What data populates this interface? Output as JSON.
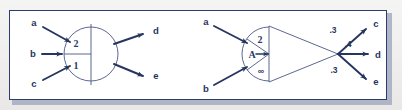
{
  "figure": {
    "background_color": "#f1f0ee",
    "panel_color": "#ffffff",
    "border_color": "#2d3d6b",
    "ink_color": "#27355f",
    "diagrams": [
      {
        "id": "left-diagram",
        "shape": "circle-split-quadrants",
        "inputs": [
          {
            "label": "a"
          },
          {
            "label": "b"
          },
          {
            "label": "c"
          }
        ],
        "node_cells": [
          {
            "label": "2"
          },
          {
            "label": "1"
          }
        ],
        "outputs": [
          {
            "label": "d"
          },
          {
            "label": "e"
          }
        ]
      },
      {
        "id": "right-diagram",
        "shape": "semicircle-triangle",
        "inputs": [
          {
            "label": "a"
          },
          {
            "label": "b"
          }
        ],
        "node_cells": [
          {
            "label": "2"
          },
          {
            "label": "A"
          },
          {
            "label": "∞"
          }
        ],
        "outputs": [
          {
            "label": "c",
            "weight": ".3"
          },
          {
            "label": "d",
            "weight": ".4"
          },
          {
            "label": "e",
            "weight": ".3"
          }
        ]
      }
    ]
  }
}
